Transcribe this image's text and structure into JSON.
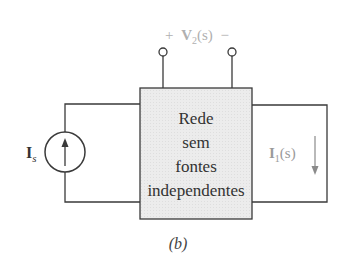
{
  "diagram": {
    "caption": "(b)",
    "network_box": {
      "lines": [
        "Rede",
        "sem",
        "fontes",
        "independentes"
      ],
      "fill": "#ebebeb",
      "stroke": "#3a3a3a"
    },
    "voltage_label": {
      "plus": "+",
      "symbol": "V",
      "subscript": "2",
      "arg": "(s)",
      "minus": "−",
      "color": "#b0b0b0"
    },
    "source_label": {
      "symbol": "I",
      "subscript": "s",
      "color": "#333333"
    },
    "current_label": {
      "symbol": "I",
      "subscript": "1",
      "arg": "(s)",
      "color": "#9a9a9a"
    },
    "wire_color": "#3a3a3a"
  }
}
